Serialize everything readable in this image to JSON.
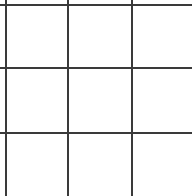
{
  "canvas": {
    "width": 192,
    "height": 196,
    "background_color": "#ffffff"
  },
  "grid": {
    "name": "blank-grid",
    "line_color": "#3a3a3a",
    "line_thickness_px": 2,
    "cell_fill_color": "#ffffff",
    "columns_visible": 3,
    "rows_visible": 3,
    "cropped_right": true,
    "cropped_bottom": true,
    "vertical_line_positions": [
      5,
      67,
      131
    ],
    "horizontal_line_positions": [
      4,
      67,
      132
    ],
    "cell_width_px": 62,
    "cell_height_px": 63,
    "cells": [
      {
        "row": 0,
        "col": 0,
        "label": ""
      },
      {
        "row": 0,
        "col": 1,
        "label": ""
      },
      {
        "row": 0,
        "col": 2,
        "label": ""
      },
      {
        "row": 1,
        "col": 0,
        "label": ""
      },
      {
        "row": 1,
        "col": 1,
        "label": ""
      },
      {
        "row": 1,
        "col": 2,
        "label": ""
      },
      {
        "row": 2,
        "col": 0,
        "label": ""
      },
      {
        "row": 2,
        "col": 1,
        "label": ""
      },
      {
        "row": 2,
        "col": 2,
        "label": ""
      }
    ]
  }
}
